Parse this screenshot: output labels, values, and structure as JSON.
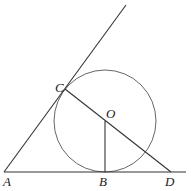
{
  "diagram": {
    "points": {
      "A": {
        "label": "A",
        "x": 4,
        "y": 172
      },
      "B": {
        "label": "B",
        "x": 105,
        "y": 172
      },
      "C": {
        "label": "C",
        "x": 65,
        "y": 89
      },
      "D": {
        "label": "D",
        "x": 171,
        "y": 172
      },
      "O": {
        "label": "O",
        "x": 105,
        "y": 121
      }
    },
    "labels": {
      "A": "A",
      "B": "B",
      "C": "C",
      "D": "D",
      "O": "O"
    },
    "circle": {
      "center": "O",
      "cx": 105,
      "cy": 121,
      "r": 51
    },
    "segments": [
      {
        "from": "A",
        "to": "ray-end",
        "desc": "ray from A through C"
      },
      {
        "from": "A",
        "to": "baseline-end",
        "desc": "baseline through B and D"
      },
      {
        "from": "C",
        "to": "D",
        "desc": "line through O"
      },
      {
        "from": "O",
        "to": "B",
        "desc": "radius perpendicular to AD"
      }
    ],
    "stroke_color": "#333333",
    "circle_color": "#666666"
  }
}
